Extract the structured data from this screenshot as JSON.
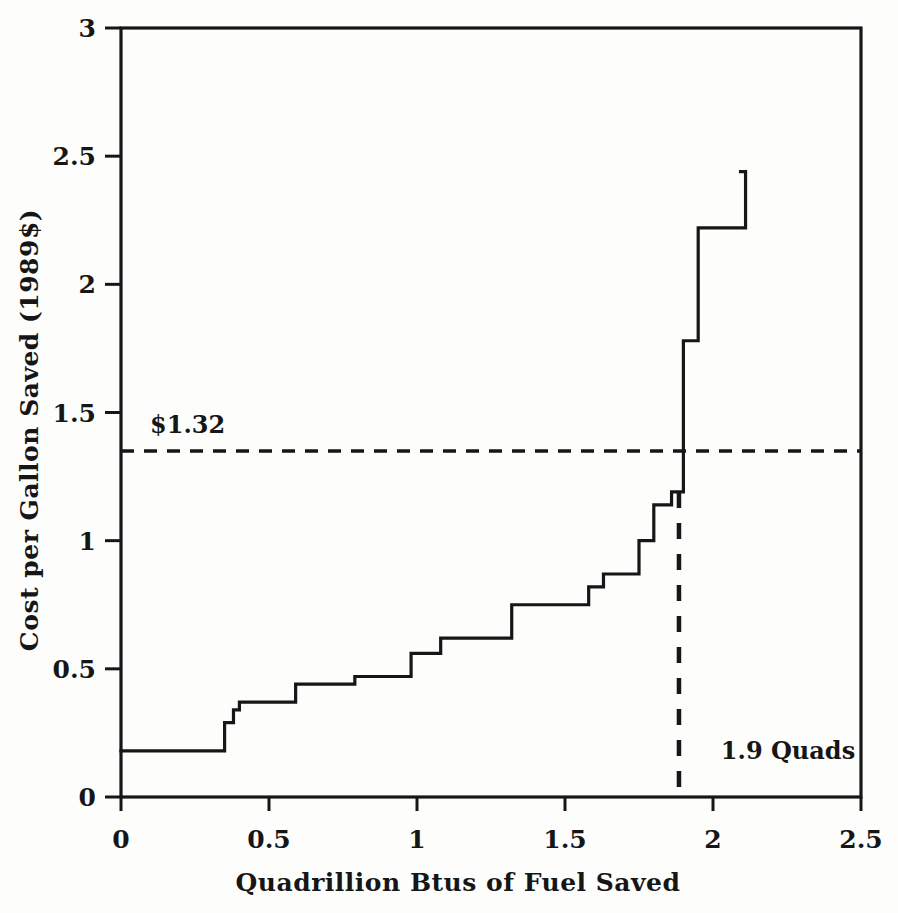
{
  "chart_data": {
    "type": "line",
    "subtype": "step-function-supply-curve",
    "title": "",
    "xlabel": "Quadrillion Btus of Fuel Saved",
    "ylabel": "Cost per Gallon Saved (1989$)",
    "xlim": [
      0,
      2.5
    ],
    "ylim": [
      0,
      3
    ],
    "grid": false,
    "legend": "none",
    "x_axis": {
      "tick_values": [
        0,
        0.5,
        1,
        1.5,
        2,
        2.5
      ],
      "tick_labels": [
        "0",
        "0.5",
        "1",
        "1.5",
        "2",
        "2.5"
      ]
    },
    "y_axis": {
      "tick_values": [
        0,
        0.5,
        1,
        1.5,
        2,
        2.5,
        3
      ],
      "tick_labels": [
        "0",
        "0.5",
        "1",
        "1.5",
        "2",
        "2.5",
        "3"
      ]
    },
    "steps": [
      {
        "x0": 0.0,
        "x1": 0.35,
        "cost": 0.18
      },
      {
        "x0": 0.35,
        "x1": 0.38,
        "cost": 0.29
      },
      {
        "x0": 0.38,
        "x1": 0.4,
        "cost": 0.34
      },
      {
        "x0": 0.4,
        "x1": 0.59,
        "cost": 0.37
      },
      {
        "x0": 0.59,
        "x1": 0.79,
        "cost": 0.44
      },
      {
        "x0": 0.79,
        "x1": 0.98,
        "cost": 0.47
      },
      {
        "x0": 0.98,
        "x1": 1.08,
        "cost": 0.56
      },
      {
        "x0": 1.08,
        "x1": 1.32,
        "cost": 0.62
      },
      {
        "x0": 1.32,
        "x1": 1.58,
        "cost": 0.75
      },
      {
        "x0": 1.58,
        "x1": 1.63,
        "cost": 0.82
      },
      {
        "x0": 1.63,
        "x1": 1.75,
        "cost": 0.87
      },
      {
        "x0": 1.75,
        "x1": 1.8,
        "cost": 1.0
      },
      {
        "x0": 1.8,
        "x1": 1.86,
        "cost": 1.14
      },
      {
        "x0": 1.86,
        "x1": 1.9,
        "cost": 1.19
      },
      {
        "x0": 1.9,
        "x1": 1.95,
        "cost": 1.78
      },
      {
        "x0": 1.95,
        "x1": 2.11,
        "cost": 2.22
      }
    ],
    "final_rise": {
      "x": 2.11,
      "y_top": 2.44
    },
    "guides": {
      "horizontal": {
        "value": 1.32,
        "drawn_y": 1.35,
        "label": "$1.32"
      },
      "vertical": {
        "value": 1.9,
        "drawn_x": 1.885,
        "y_top": 1.19,
        "label": "1.9 Quads"
      }
    },
    "colors": {
      "ink": "#161616",
      "background": "#fdfdfc"
    }
  }
}
